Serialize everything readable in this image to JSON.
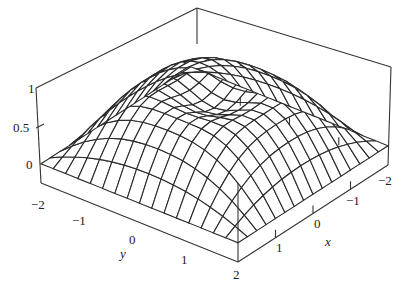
{
  "chart_data": {
    "type": "surface3d",
    "title": "",
    "xlabel": "x",
    "ylabel": "y",
    "zlabel": "",
    "x_range": [
      -2,
      2
    ],
    "y_range": [
      -2,
      2
    ],
    "z_range": [
      0,
      1
    ],
    "x_ticks": [
      "-2",
      "-1",
      "0",
      "1"
    ],
    "y_ticks": [
      "-2",
      "-1",
      "0",
      "1",
      "2"
    ],
    "z_ticks": [
      "0",
      "0.5",
      "1"
    ],
    "grid_lines": 17,
    "line_color": "#2a2a2a",
    "box_color": "#333333"
  },
  "labels": {
    "z": [
      {
        "text": "1",
        "x": 28,
        "y": 82
      },
      {
        "text": "0.5",
        "x": 13,
        "y": 121
      },
      {
        "text": "0",
        "x": 26,
        "y": 158
      }
    ],
    "y": [
      {
        "text": "−2",
        "x": 31,
        "y": 198
      },
      {
        "text": "−1",
        "x": 72,
        "y": 214
      },
      {
        "text": "0",
        "x": 129,
        "y": 233
      },
      {
        "text": "1",
        "x": 181,
        "y": 253
      },
      {
        "text": "2",
        "x": 233,
        "y": 268
      }
    ],
    "x": [
      {
        "text": "1",
        "x": 276,
        "y": 241
      },
      {
        "text": "0",
        "x": 314,
        "y": 217
      },
      {
        "text": "−1",
        "x": 346,
        "y": 194
      },
      {
        "text": "−2",
        "x": 378,
        "y": 174
      }
    ],
    "y_name": {
      "text": "y",
      "x": 120,
      "y": 247
    },
    "x_name": {
      "text": "x",
      "x": 325,
      "y": 235
    }
  }
}
